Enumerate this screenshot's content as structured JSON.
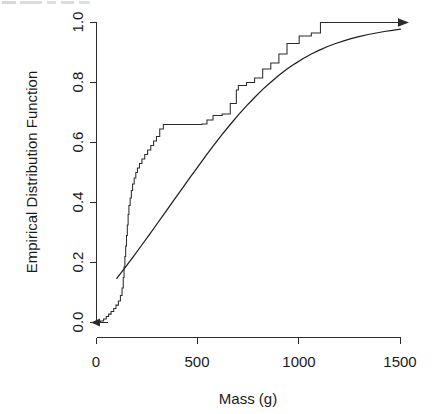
{
  "chart_data": {
    "type": "line",
    "title": "",
    "xlabel": "Mass (g)",
    "ylabel": "Empirical Distribution Function",
    "xlim": [
      0,
      1540
    ],
    "ylim": [
      0.0,
      1.0
    ],
    "grid": false,
    "legend": null,
    "xticks": [
      0,
      500,
      1000,
      1500
    ],
    "xticklabels": [
      "0",
      "500",
      "1000",
      "1500"
    ],
    "yticks": [
      0.0,
      0.2,
      0.4,
      0.6,
      0.8,
      1.0
    ],
    "yticklabels": [
      "0.0",
      "0.2",
      "0.4",
      "0.6",
      "0.8",
      "1.0"
    ],
    "annotations": [
      "left-pointing arrow at y=0 extending below lowest data",
      "right-pointing arrow at y=1 extending to x=1540"
    ],
    "series": [
      {
        "name": "Empirical distribution function (step)",
        "type": "step",
        "style": "stepwise-post",
        "x": [
          5,
          20,
          35,
          48,
          60,
          72,
          85,
          96,
          108,
          118,
          126,
          132,
          136,
          140,
          144,
          148,
          152,
          156,
          160,
          166,
          172,
          178,
          186,
          194,
          202,
          212,
          224,
          238,
          252,
          268,
          282,
          296,
          312,
          330,
          520,
          545,
          575,
          620,
          660,
          690,
          700,
          740,
          780,
          820,
          860,
          900,
          940,
          1000,
          1060,
          1105,
          1500
        ],
        "y": [
          0.0,
          0.005,
          0.012,
          0.02,
          0.028,
          0.037,
          0.047,
          0.058,
          0.072,
          0.09,
          0.115,
          0.15,
          0.185,
          0.22,
          0.255,
          0.29,
          0.325,
          0.36,
          0.39,
          0.415,
          0.44,
          0.462,
          0.482,
          0.5,
          0.515,
          0.53,
          0.545,
          0.56,
          0.575,
          0.59,
          0.605,
          0.62,
          0.645,
          0.66,
          0.662,
          0.675,
          0.69,
          0.695,
          0.73,
          0.775,
          0.79,
          0.8,
          0.815,
          0.845,
          0.865,
          0.895,
          0.93,
          0.955,
          0.965,
          1.0,
          1.0
        ]
      },
      {
        "name": "Fitted theoretical distribution (smooth)",
        "type": "line",
        "style": "smooth",
        "x": [
          100,
          140,
          180,
          220,
          260,
          300,
          340,
          380,
          420,
          460,
          500,
          540,
          580,
          620,
          660,
          700,
          740,
          780,
          820,
          860,
          900,
          940,
          980,
          1020,
          1060,
          1100,
          1140,
          1180,
          1220,
          1260,
          1300,
          1340,
          1380,
          1420,
          1460,
          1500
        ],
        "y": [
          0.147,
          0.182,
          0.218,
          0.255,
          0.292,
          0.33,
          0.368,
          0.406,
          0.444,
          0.482,
          0.519,
          0.556,
          0.592,
          0.627,
          0.66,
          0.692,
          0.722,
          0.75,
          0.777,
          0.801,
          0.824,
          0.845,
          0.863,
          0.88,
          0.895,
          0.908,
          0.92,
          0.93,
          0.939,
          0.947,
          0.954,
          0.96,
          0.965,
          0.97,
          0.974,
          0.978
        ]
      }
    ]
  },
  "axes": {
    "x_title": "Mass (g)",
    "y_title": "Empirical Distribution Function",
    "x_tick_labels": [
      "0",
      "500",
      "1000",
      "1500"
    ],
    "y_tick_labels": [
      "0.0",
      "0.2",
      "0.4",
      "0.6",
      "0.8",
      "1.0"
    ]
  },
  "header": {
    "clipped_text": ""
  },
  "colors": {
    "axis": "#2b2b2b",
    "step_curve": "#2b2b2b",
    "model_curve": "#1f1f1f",
    "background": "#ffffff",
    "text": "#1a1a1a"
  }
}
